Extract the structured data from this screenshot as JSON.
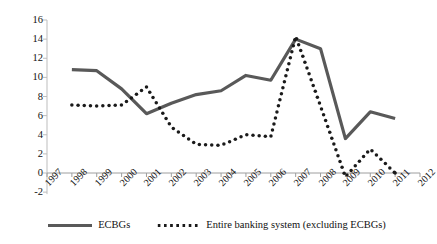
{
  "chart_data": {
    "type": "line",
    "title": "",
    "xlabel": "",
    "ylabel": "",
    "grid": false,
    "legend_position": "bottom",
    "categories": [
      "1997",
      "1998",
      "1999",
      "2000",
      "2001",
      "2002",
      "2003",
      "2004",
      "2005",
      "2006",
      "2007",
      "2008",
      "2009",
      "2010",
      "2011",
      "2012"
    ],
    "x_tick_labels": [
      "1997",
      "1998",
      "1999",
      "2000",
      "2001",
      "2002",
      "2003",
      "2004",
      "2005",
      "2006",
      "2007",
      "2008",
      "2009",
      "2010",
      "2011",
      "2012"
    ],
    "y_tick_labels": [
      "16",
      "14",
      "12",
      "10",
      "8",
      "6",
      "4",
      "2",
      "0",
      "-2"
    ],
    "y_ticks": [
      16,
      14,
      12,
      10,
      8,
      6,
      4,
      2,
      0,
      -2
    ],
    "ylim": [
      -2,
      16
    ],
    "xlim": [
      "1997",
      "2012"
    ],
    "series": [
      {
        "name": "ECBGs",
        "style": "solid",
        "color": "#595959",
        "x": [
          "1998",
          "1999",
          "2000",
          "2001",
          "2002",
          "2003",
          "2004",
          "2005",
          "2006",
          "2007",
          "2008",
          "2009",
          "2010",
          "2011"
        ],
        "values": [
          10.8,
          10.7,
          8.8,
          6.2,
          7.3,
          8.2,
          8.6,
          10.2,
          9.7,
          14.0,
          13.0,
          3.6,
          6.4,
          5.7
        ]
      },
      {
        "name": "Entire banking system (excluding ECBGs)",
        "style": "dotted",
        "color": "#1a1a1a",
        "x": [
          "1998",
          "1999",
          "2000",
          "2001",
          "2002",
          "2003",
          "2004",
          "2005",
          "2006",
          "2007",
          "2008",
          "2009",
          "2010",
          "2011"
        ],
        "values": [
          7.1,
          7.0,
          7.1,
          9.0,
          4.8,
          3.0,
          2.9,
          4.0,
          3.8,
          14.3,
          7.0,
          -0.4,
          2.5,
          0.0
        ]
      }
    ]
  },
  "legend": {
    "items": [
      {
        "label": "ECBGs",
        "style": "solid"
      },
      {
        "label": "Entire banking system (excluding ECBGs)",
        "style": "dotted"
      }
    ]
  }
}
